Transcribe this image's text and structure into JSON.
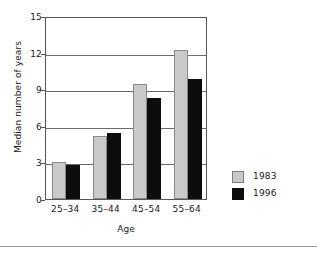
{
  "chart_data": {
    "type": "bar",
    "title": "",
    "subtitle": "",
    "xlabel": "Age",
    "ylabel": "Median number of years",
    "categories": [
      "25–34",
      "35–44",
      "45–54",
      "55–64"
    ],
    "series": [
      {
        "name": "1983",
        "color": "#c9c9c9",
        "values": [
          3.0,
          5.2,
          9.4,
          12.2
        ]
      },
      {
        "name": "1996",
        "color": "#0d0d0d",
        "values": [
          2.8,
          5.4,
          8.3,
          9.8
        ]
      }
    ],
    "ylim": [
      0,
      15
    ],
    "xlim_note": "categorical",
    "yticks": [
      "0",
      "3",
      "6",
      "9",
      "12",
      "15"
    ],
    "ytick_values": [
      0,
      3,
      6,
      9,
      12,
      15
    ],
    "grid": "horizontal",
    "legend_position": "right",
    "annotations": []
  },
  "axes": {
    "y_title": "Median number of years",
    "x_title": "Age",
    "y_ticks": [
      {
        "label": "15",
        "value": 15
      },
      {
        "label": "12",
        "value": 12
      },
      {
        "label": "9",
        "value": 9
      },
      {
        "label": "6",
        "value": 6
      },
      {
        "label": "3",
        "value": 3
      },
      {
        "label": "0",
        "value": 0
      }
    ],
    "x_ticks": [
      {
        "label": "25–34"
      },
      {
        "label": "35–44"
      },
      {
        "label": "45–54"
      },
      {
        "label": "55–64"
      }
    ]
  },
  "legend": {
    "entries": [
      {
        "label": "1983",
        "color": "#c9c9c9"
      },
      {
        "label": "1996",
        "color": "#0d0d0d"
      }
    ]
  },
  "colors": {
    "series_1983": "#c9c9c9",
    "series_1996": "#0d0d0d",
    "frame": "#555555",
    "gridline": "#6b6b6b",
    "text": "#1a1a1a",
    "rule": "#9a9a9a",
    "background": "#ffffff"
  }
}
